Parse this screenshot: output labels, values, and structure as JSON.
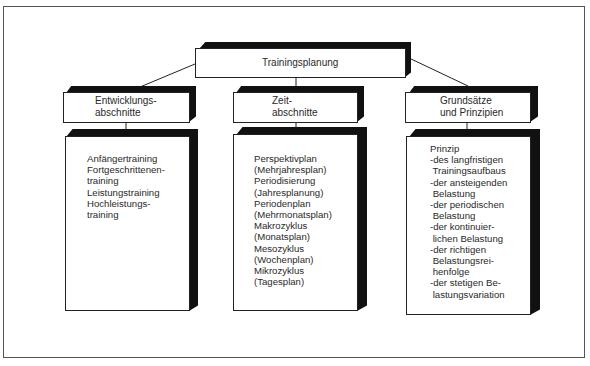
{
  "diagram": {
    "title": "Trainingsplanung",
    "columns": [
      {
        "header": "Entwicklungs-\nabschnitte",
        "items": [
          "Anfängertraining",
          "Fortgeschrittenen-",
          "training",
          "Leistungstraining",
          "Hochleistungs-",
          "training"
        ]
      },
      {
        "header": "Zeit-\nabschnitte",
        "items": [
          "Perspektivplan",
          "(Mehrjahresplan)",
          "Periodisierung",
          "(Jahresplanung)",
          "Periodenplan",
          "(Mehrmonatsplan)",
          "Makrozyklus",
          "(Monatsplan)",
          "Mesozyklus",
          "(Wochenplan)",
          "Mikrozyklus",
          "(Tagesplan)"
        ]
      },
      {
        "header": "Grundsätze\nund Prinzipien",
        "items": [
          "Prinzip",
          "-des langfristigen",
          " Trainingsaufbaus",
          "-der ansteigenden",
          " Belastung",
          "-der periodischen",
          " Belastung",
          "-der kontinuier-",
          " lichen Belastung",
          "-der richtigen",
          " Belastungsrei-",
          " henfolge",
          "-der stetigen Be-",
          " lastungsvariation"
        ]
      }
    ],
    "colors": {
      "line": "#222222",
      "shadow": "#111111",
      "face": "#ffffff",
      "text": "#2a2a2a"
    }
  }
}
